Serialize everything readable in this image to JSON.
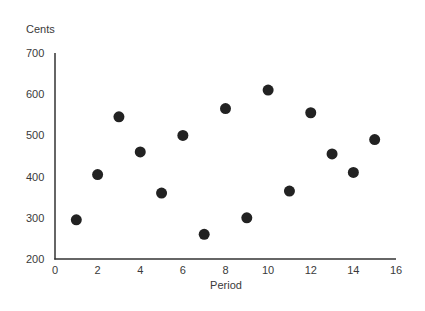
{
  "chart_data": {
    "type": "scatter",
    "title": "",
    "xlabel": "Period",
    "ylabel": "Cents",
    "xlim": [
      0,
      16
    ],
    "ylim": [
      200,
      700
    ],
    "x_ticks": [
      0,
      2,
      4,
      6,
      8,
      10,
      12,
      14,
      16
    ],
    "y_ticks": [
      200,
      300,
      400,
      500,
      600,
      700
    ],
    "grid": false,
    "legend": null,
    "marker_color": "#222222",
    "series": [
      {
        "name": "Cents",
        "points": [
          {
            "x": 1,
            "y": 295
          },
          {
            "x": 2,
            "y": 405
          },
          {
            "x": 3,
            "y": 545
          },
          {
            "x": 4,
            "y": 460
          },
          {
            "x": 5,
            "y": 360
          },
          {
            "x": 6,
            "y": 500
          },
          {
            "x": 7,
            "y": 260
          },
          {
            "x": 8,
            "y": 565
          },
          {
            "x": 9,
            "y": 300
          },
          {
            "x": 10,
            "y": 610
          },
          {
            "x": 11,
            "y": 365
          },
          {
            "x": 12,
            "y": 555
          },
          {
            "x": 13,
            "y": 455
          },
          {
            "x": 14,
            "y": 410
          },
          {
            "x": 15,
            "y": 490
          }
        ]
      }
    ]
  }
}
